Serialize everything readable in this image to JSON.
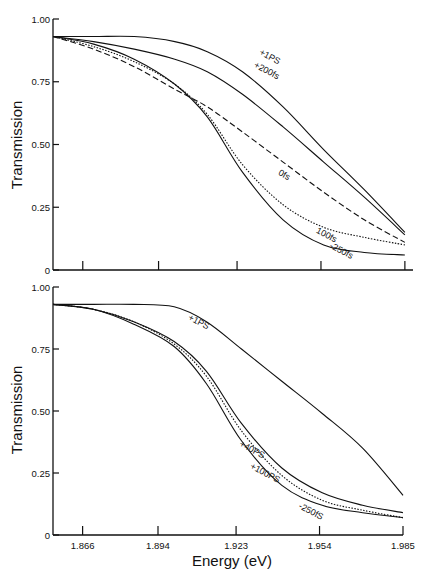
{
  "chart_data": [
    {
      "type": "line",
      "panel": "top",
      "title": "",
      "xlabel": "",
      "ylabel": "Transmission",
      "xlim": [
        1.855,
        1.988
      ],
      "ylim": [
        0,
        1.0
      ],
      "yticks": [
        "0",
        "0.25",
        "0.50",
        "0.75",
        "1.00"
      ],
      "xticks": [
        1.866,
        1.894,
        1.923,
        1.954,
        1.985
      ],
      "xtick_labels": [],
      "grid": false,
      "series": [
        {
          "name": "+1PS",
          "style": "solid",
          "x": [
            1.855,
            1.87,
            1.885,
            1.9,
            1.912,
            1.925,
            1.94,
            1.955,
            1.97,
            1.985
          ],
          "y": [
            0.93,
            0.93,
            0.93,
            0.91,
            0.87,
            0.79,
            0.65,
            0.48,
            0.32,
            0.15
          ]
        },
        {
          "name": "+200fs",
          "style": "solid",
          "x": [
            1.855,
            1.87,
            1.885,
            1.9,
            1.912,
            1.925,
            1.94,
            1.955,
            1.97,
            1.985
          ],
          "y": [
            0.93,
            0.91,
            0.88,
            0.84,
            0.79,
            0.7,
            0.57,
            0.43,
            0.29,
            0.14
          ]
        },
        {
          "name": "0fs",
          "style": "dashed",
          "x": [
            1.855,
            1.87,
            1.885,
            1.9,
            1.912,
            1.925,
            1.94,
            1.955,
            1.97,
            1.985
          ],
          "y": [
            0.93,
            0.88,
            0.81,
            0.72,
            0.65,
            0.55,
            0.43,
            0.31,
            0.2,
            0.11
          ]
        },
        {
          "name": "100fs",
          "style": "dotted",
          "x": [
            1.855,
            1.87,
            1.885,
            1.9,
            1.912,
            1.925,
            1.94,
            1.955,
            1.97,
            1.985
          ],
          "y": [
            0.93,
            0.89,
            0.83,
            0.74,
            0.62,
            0.42,
            0.26,
            0.17,
            0.13,
            0.1
          ]
        },
        {
          "name": "250fs",
          "style": "solid",
          "x": [
            1.855,
            1.87,
            1.885,
            1.9,
            1.912,
            1.925,
            1.94,
            1.955,
            1.97,
            1.985
          ],
          "y": [
            0.93,
            0.9,
            0.84,
            0.74,
            0.61,
            0.39,
            0.2,
            0.1,
            0.07,
            0.06
          ]
        }
      ],
      "annotations": [
        {
          "text": "+1PS",
          "x": 1.931,
          "y": 0.86
        },
        {
          "text": "+200fs",
          "x": 1.929,
          "y": 0.81
        },
        {
          "text": "0fs",
          "x": 1.938,
          "y": 0.38
        },
        {
          "text": "100fs",
          "x": 1.952,
          "y": 0.15
        },
        {
          "text": "-250fs",
          "x": 1.957,
          "y": 0.09
        }
      ]
    },
    {
      "type": "line",
      "panel": "bottom",
      "title": "",
      "xlabel": "Energy (eV)",
      "ylabel": "Transmission",
      "xlim": [
        1.855,
        1.985
      ],
      "ylim": [
        0,
        1.0
      ],
      "yticks": [
        "0",
        "0.25",
        "0.50",
        "0.75",
        "1.00"
      ],
      "xticks": [
        1.866,
        1.894,
        1.923,
        1.954,
        1.985
      ],
      "xtick_labels": [
        "1.866",
        "1.894",
        "1.923",
        "1.954",
        "1.985"
      ],
      "grid": false,
      "series": [
        {
          "name": "+1PS",
          "style": "solid",
          "x": [
            1.855,
            1.87,
            1.885,
            1.9,
            1.912,
            1.925,
            1.94,
            1.955,
            1.97,
            1.985
          ],
          "y": [
            0.93,
            0.93,
            0.93,
            0.92,
            0.86,
            0.75,
            0.62,
            0.49,
            0.35,
            0.16
          ]
        },
        {
          "name": "+40PS",
          "style": "solid",
          "x": [
            1.855,
            1.87,
            1.885,
            1.9,
            1.912,
            1.925,
            1.94,
            1.955,
            1.97,
            1.985
          ],
          "y": [
            0.93,
            0.91,
            0.86,
            0.78,
            0.66,
            0.45,
            0.27,
            0.17,
            0.12,
            0.09
          ]
        },
        {
          "name": "+100PS",
          "style": "dotted",
          "x": [
            1.855,
            1.87,
            1.885,
            1.9,
            1.912,
            1.925,
            1.94,
            1.955,
            1.97,
            1.985
          ],
          "y": [
            0.93,
            0.91,
            0.86,
            0.77,
            0.64,
            0.42,
            0.24,
            0.14,
            0.1,
            0.07
          ]
        },
        {
          "name": "250fs",
          "style": "solid",
          "x": [
            1.855,
            1.87,
            1.885,
            1.9,
            1.912,
            1.925,
            1.94,
            1.955,
            1.97,
            1.985
          ],
          "y": [
            0.93,
            0.91,
            0.85,
            0.76,
            0.61,
            0.38,
            0.2,
            0.12,
            0.09,
            0.07
          ]
        }
      ],
      "annotations": [
        {
          "text": "+1PS",
          "x": 1.905,
          "y": 0.87
        },
        {
          "text": "+40PS",
          "x": 1.924,
          "y": 0.36
        },
        {
          "text": "+100PS",
          "x": 1.928,
          "y": 0.27
        },
        {
          "text": "-250fS",
          "x": 1.946,
          "y": 0.11
        }
      ]
    }
  ],
  "labels": {
    "ylabel_top": "Transmission",
    "ylabel_bottom": "Transmission",
    "xlabel": "Energy (eV)"
  },
  "colors": {
    "ink": "#111111",
    "background": "#ffffff"
  }
}
